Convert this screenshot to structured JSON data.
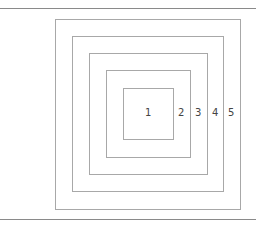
{
  "diagram": {
    "type": "nested-squares",
    "labels": [
      "1",
      "2",
      "3",
      "4",
      "5"
    ],
    "colors": {
      "line": "#a8a8a8",
      "rule": "#8a8a8a",
      "text": "#444444"
    }
  }
}
